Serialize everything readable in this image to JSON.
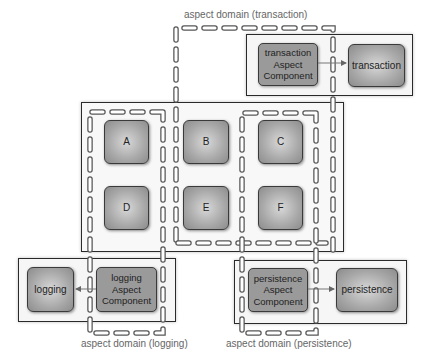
{
  "diagram": {
    "domains": {
      "transaction": {
        "label": "aspect domain (transaction)"
      },
      "logging": {
        "label": "aspect domain (logging)"
      },
      "persistence": {
        "label": "aspect domain (persistence)"
      }
    },
    "core_components": [
      {
        "id": "A",
        "label": "A"
      },
      {
        "id": "B",
        "label": "B"
      },
      {
        "id": "C",
        "label": "C"
      },
      {
        "id": "D",
        "label": "D"
      },
      {
        "id": "E",
        "label": "E"
      },
      {
        "id": "F",
        "label": "F"
      }
    ],
    "transaction": {
      "aspect_component": "transaction\nAspect\nComponent",
      "target": "transaction"
    },
    "logging": {
      "aspect_component": "logging\nAspect\nComponent",
      "target": "logging"
    },
    "persistence": {
      "aspect_component": "persistence\nAspect\nComponent",
      "target": "persistence"
    },
    "colors": {
      "frame": "#2a2a2a",
      "component_fill": "#a8a8a8",
      "aspect_fill": "#9a9a9a",
      "dash_outline": "#555555",
      "label_text": "#666666"
    }
  }
}
